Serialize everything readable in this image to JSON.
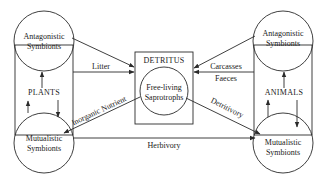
{
  "diagram": {
    "plants": {
      "label": "PLANTS",
      "antagonistic": [
        "Antagonistic",
        "Symbionts"
      ],
      "mutualistic": [
        "Mutualistic",
        "Symbionts"
      ]
    },
    "animals": {
      "label": "ANIMALS",
      "antagonistic": [
        "Antagonistic",
        "Symbionts"
      ],
      "mutualistic": [
        "Mutualistic",
        "Symbionts"
      ]
    },
    "detritus": {
      "label": "DETRITUS",
      "saprotrophs": [
        "Free-living",
        "Saprotrophs"
      ]
    },
    "flows": {
      "litter": "Litter",
      "carcasses": "Carcasses",
      "faeces": "Faeces",
      "inorganic_nutrient": "Inorganic Nutrient",
      "detritivory": "Detritivory",
      "herbivory": "Herbivory"
    },
    "colors": {
      "ink": "#2a2a2a",
      "background": "#ffffff"
    }
  }
}
